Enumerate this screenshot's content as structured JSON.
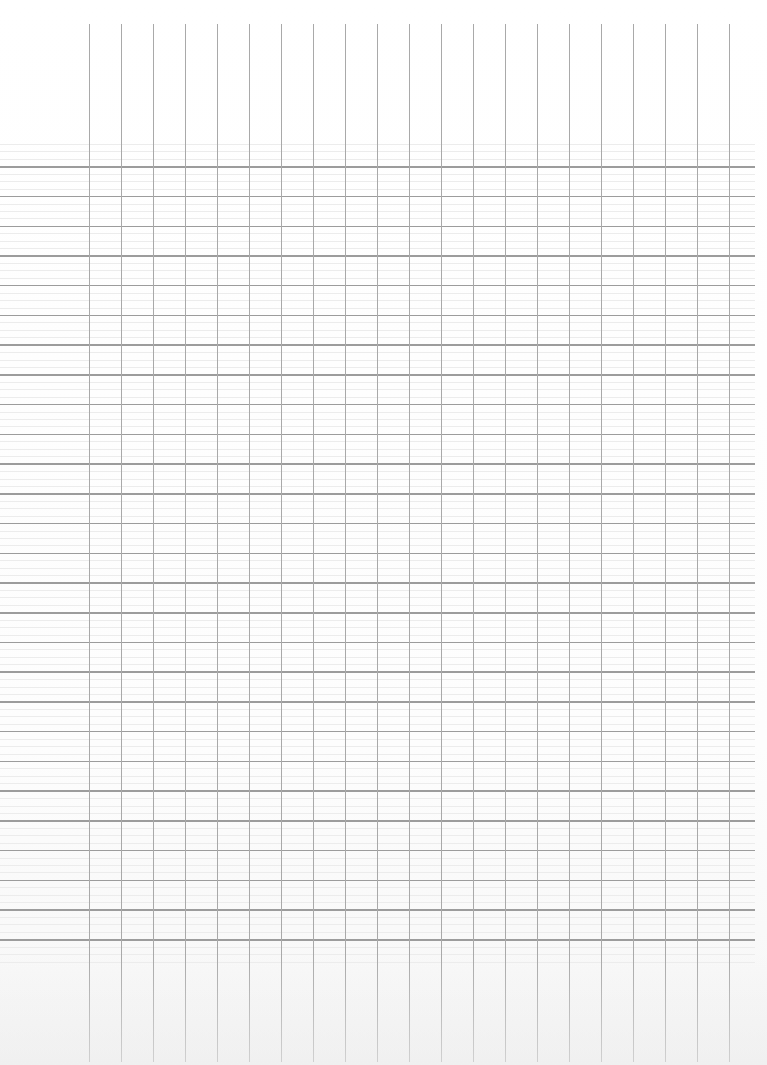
{
  "page": {
    "type": "blank grid sheet",
    "width": 767,
    "height": 1065,
    "background_color": "#ffffff"
  },
  "grid": {
    "vertical_lines": {
      "count": 21,
      "x_start": 89,
      "spacing": 32,
      "y_top": 24,
      "y_bottom": 1062,
      "color": "#a9a9a9"
    },
    "major_horizontal_lines": {
      "count": 27,
      "y_start": 166,
      "spacing": 29.73,
      "x_left": 0,
      "x_right": 755,
      "color": "#9c9c9c"
    },
    "minor_horizontal_lines": {
      "per_interval": 3,
      "y_start": 144,
      "y_end": 963,
      "color": "#ececec"
    }
  }
}
